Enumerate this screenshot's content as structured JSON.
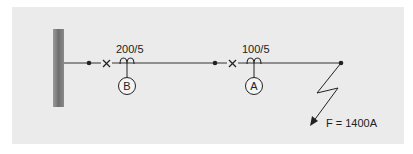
{
  "diagram": {
    "ct_b": {
      "ratio": "200/5",
      "relay_label": "B"
    },
    "ct_a": {
      "ratio": "100/5",
      "relay_label": "A"
    },
    "fault": {
      "label": "F = 1400A"
    },
    "colors": {
      "background": "#ebebeb",
      "bus": "#7a7a7a",
      "line": "#333333"
    }
  }
}
